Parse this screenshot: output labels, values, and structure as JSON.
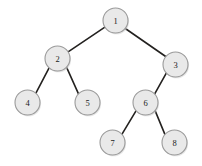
{
  "figure": {
    "kind": "binary-tree-diagram",
    "width": 202,
    "height": 166,
    "background_color": "#ffffff"
  },
  "style": {
    "node_fill": "#e9e9e9",
    "node_stroke": "#9a9a9a",
    "node_radius": 12.5,
    "edge_color": "#23211f",
    "edge_width": 1.6,
    "label_color": "#1a1a1a"
  },
  "nodes": [
    {
      "id": "1",
      "label": "1",
      "cx": 115.5,
      "cy": 20.5,
      "r": 12.5
    },
    {
      "id": "2",
      "label": "2",
      "cx": 57.5,
      "cy": 58.5,
      "r": 12.5
    },
    {
      "id": "3",
      "label": "3",
      "cx": 175.5,
      "cy": 64.5,
      "r": 12.5
    },
    {
      "id": "4",
      "label": "4",
      "cx": 27.5,
      "cy": 102.5,
      "r": 12.5
    },
    {
      "id": "5",
      "label": "5",
      "cx": 87.5,
      "cy": 102.5,
      "r": 12.5
    },
    {
      "id": "6",
      "label": "6",
      "cx": 145.5,
      "cy": 102.5,
      "r": 12.5
    },
    {
      "id": "7",
      "label": "7",
      "cx": 112.5,
      "cy": 142.5,
      "r": 12.5
    },
    {
      "id": "8",
      "label": "8",
      "cx": 174.5,
      "cy": 142.5,
      "r": 12.5
    }
  ],
  "edges": [
    {
      "id": "edge-1-2",
      "from": "1",
      "to": "2",
      "x1": 104.9,
      "y1": 27.1,
      "x2": 68.1,
      "y2": 51.9
    },
    {
      "id": "edge-1-3",
      "from": "1",
      "to": "3",
      "x1": 125.3,
      "y1": 28.5,
      "x2": 165.7,
      "y2": 56.5
    },
    {
      "id": "edge-2-4",
      "from": "2",
      "to": "4",
      "x1": 49.1,
      "y1": 67.8,
      "x2": 35.9,
      "y2": 93.2
    },
    {
      "id": "edge-2-5",
      "from": "2",
      "to": "5",
      "x1": 66.5,
      "y1": 67.2,
      "x2": 78.5,
      "y2": 93.8
    },
    {
      "id": "edge-3-6",
      "from": "3",
      "to": "6",
      "x1": 166.3,
      "y1": 73.2,
      "x2": 154.7,
      "y2": 93.8
    },
    {
      "id": "edge-6-7",
      "from": "6",
      "to": "7",
      "x1": 136.0,
      "y1": 110.9,
      "x2": 122.0,
      "y2": 134.1
    },
    {
      "id": "edge-6-8",
      "from": "6",
      "to": "8",
      "x1": 155.2,
      "y1": 110.9,
      "x2": 164.8,
      "y2": 134.1
    }
  ]
}
